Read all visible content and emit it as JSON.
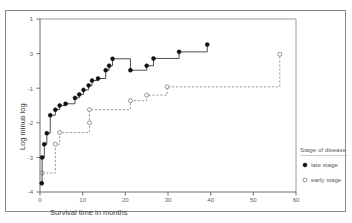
{
  "chart_data": {
    "type": "line",
    "title": "",
    "xlabel": "Survival time in months",
    "ylabel": "Log minus log",
    "xlim": [
      0,
      60
    ],
    "ylim": [
      -4,
      1
    ],
    "xticks": [
      0,
      10,
      20,
      30,
      40,
      50,
      60
    ],
    "yticks": [
      1,
      0,
      -1,
      -2,
      -3,
      -4
    ],
    "xtick_labels": [
      "0",
      "10",
      "20",
      "30",
      "40",
      "50",
      "60"
    ],
    "ytick_labels": [
      "1",
      "0",
      "-1",
      "-2",
      "-3",
      "-4"
    ],
    "grid": false,
    "legend_position": "right",
    "legend_title": "Stage of disease",
    "series": [
      {
        "name": "late stage",
        "marker": "filled-circle",
        "line_style": "solid",
        "color": "#111111",
        "points": [
          {
            "x": 0.4,
            "y": -3.75
          },
          {
            "x": 0.5,
            "y": -3.0
          },
          {
            "x": 1.0,
            "y": -2.62
          },
          {
            "x": 1.6,
            "y": -2.3
          },
          {
            "x": 2.4,
            "y": -1.78
          },
          {
            "x": 3.6,
            "y": -1.62
          },
          {
            "x": 4.6,
            "y": -1.5
          },
          {
            "x": 6.0,
            "y": -1.45
          },
          {
            "x": 8.2,
            "y": -1.28
          },
          {
            "x": 9.2,
            "y": -1.18
          },
          {
            "x": 10.2,
            "y": -1.05
          },
          {
            "x": 11.4,
            "y": -0.92
          },
          {
            "x": 12.2,
            "y": -0.78
          },
          {
            "x": 13.6,
            "y": -0.72
          },
          {
            "x": 15.4,
            "y": -0.48
          },
          {
            "x": 16.2,
            "y": -0.35
          },
          {
            "x": 17.0,
            "y": -0.15
          },
          {
            "x": 21.2,
            "y": -0.48
          },
          {
            "x": 25.0,
            "y": -0.35
          },
          {
            "x": 26.6,
            "y": -0.14
          },
          {
            "x": 32.6,
            "y": 0.05
          },
          {
            "x": 39.2,
            "y": 0.26
          }
        ]
      },
      {
        "name": "early stage",
        "marker": "open-circle",
        "line_style": "dashed",
        "color": "#7d7d7d",
        "points": [
          {
            "x": 0.5,
            "y": -3.45
          },
          {
            "x": 3.6,
            "y": -3.45
          },
          {
            "x": 3.6,
            "y": -2.62
          },
          {
            "x": 4.6,
            "y": -2.28
          },
          {
            "x": 11.6,
            "y": -2.28
          },
          {
            "x": 11.6,
            "y": -2.0
          },
          {
            "x": 11.6,
            "y": -1.62
          },
          {
            "x": 21.2,
            "y": -1.62
          },
          {
            "x": 21.2,
            "y": -1.36
          },
          {
            "x": 25.0,
            "y": -1.2
          },
          {
            "x": 29.8,
            "y": -0.96
          },
          {
            "x": 56.2,
            "y": -0.9
          },
          {
            "x": 56.2,
            "y": -0.02
          }
        ]
      }
    ],
    "late_markers": [
      {
        "x": 0.4,
        "y": -3.75
      },
      {
        "x": 0.5,
        "y": -3.0
      },
      {
        "x": 1.0,
        "y": -2.62
      },
      {
        "x": 1.6,
        "y": -2.3
      },
      {
        "x": 2.4,
        "y": -1.78
      },
      {
        "x": 3.6,
        "y": -1.62
      },
      {
        "x": 4.6,
        "y": -1.5
      },
      {
        "x": 6.0,
        "y": -1.45
      },
      {
        "x": 8.2,
        "y": -1.28
      },
      {
        "x": 9.2,
        "y": -1.18
      },
      {
        "x": 10.2,
        "y": -1.05
      },
      {
        "x": 11.4,
        "y": -0.92
      },
      {
        "x": 12.2,
        "y": -0.78
      },
      {
        "x": 13.6,
        "y": -0.72
      },
      {
        "x": 15.4,
        "y": -0.48
      },
      {
        "x": 16.2,
        "y": -0.35
      },
      {
        "x": 17.0,
        "y": -0.15
      },
      {
        "x": 21.2,
        "y": -0.48
      },
      {
        "x": 25.0,
        "y": -0.35
      },
      {
        "x": 26.6,
        "y": -0.14
      },
      {
        "x": 32.6,
        "y": 0.05
      },
      {
        "x": 39.2,
        "y": 0.26
      }
    ],
    "early_markers": [
      {
        "x": 0.5,
        "y": -3.45
      },
      {
        "x": 3.6,
        "y": -2.62
      },
      {
        "x": 4.6,
        "y": -2.28
      },
      {
        "x": 11.6,
        "y": -2.0
      },
      {
        "x": 11.6,
        "y": -1.62
      },
      {
        "x": 21.2,
        "y": -1.36
      },
      {
        "x": 25.0,
        "y": -1.2
      },
      {
        "x": 29.8,
        "y": -0.96
      },
      {
        "x": 56.2,
        "y": -0.02
      }
    ]
  },
  "legend": {
    "title": "Stage of disease",
    "items": [
      {
        "label": "late stage",
        "marker": "filled-circle"
      },
      {
        "label": "early stage",
        "marker": "open-circle"
      }
    ]
  },
  "axes": {
    "x_title": "Survival time in months",
    "y_title": "Log minus log"
  }
}
